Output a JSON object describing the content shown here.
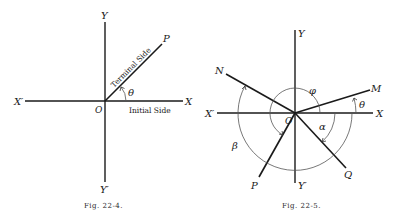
{
  "figures": [
    {
      "caption": "Fig. 22-4.",
      "labels": {
        "y_pos": "Y",
        "y_neg": "Y′",
        "x_pos": "X",
        "x_neg": "X′",
        "origin": "O",
        "point": "P",
        "angle": "θ",
        "terminal_side": "Terminal Side",
        "initial_side": "Initial Side"
      }
    },
    {
      "caption": "Fig. 22-5.",
      "labels": {
        "y_pos": "Y",
        "y_neg": "Y′",
        "x_pos": "X",
        "x_neg": "X′",
        "origin": "O",
        "ray_m": "M",
        "ray_n": "N",
        "ray_p": "P",
        "ray_q": "Q",
        "angle_theta": "θ",
        "angle_phi": "φ",
        "angle_alpha": "α",
        "angle_beta": "β"
      }
    }
  ],
  "colors": {
    "line": "#1a1a1a",
    "arc": "#555555",
    "background": "#ffffff"
  }
}
